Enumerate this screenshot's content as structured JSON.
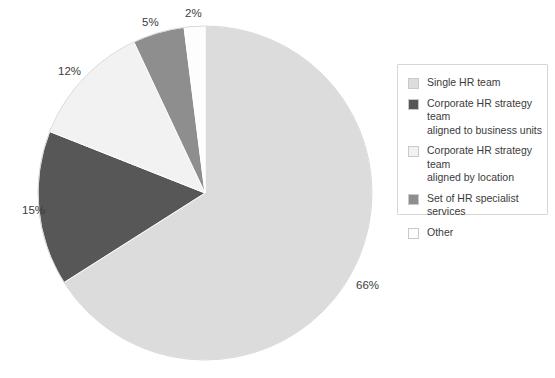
{
  "chart_data": {
    "type": "pie",
    "title": "",
    "subtitle": "",
    "xlabel": "",
    "ylabel": "",
    "legend_position": "right",
    "grid": false,
    "start_angle_deg": 0,
    "direction": "clockwise",
    "center": {
      "x": 205,
      "y": 193
    },
    "radius": 167,
    "categories": [
      "Single HR team",
      "Corporate HR strategy team aligned to business units",
      "Corporate HR strategy team aligned by location",
      "Set of HR specialist services",
      "Other"
    ],
    "values": [
      66,
      15,
      12,
      5,
      2
    ],
    "value_labels": [
      "66%",
      "15%",
      "12%",
      "5%",
      "2%"
    ],
    "unit": "%",
    "colors": [
      "#dcdcdc",
      "#575757",
      "#f2f2f2",
      "#8e8e8e",
      "#fdfdfd"
    ],
    "slices": [
      {
        "label": "Single HR team",
        "value": 66,
        "value_label": "66%",
        "color": "#dcdcdc",
        "label_x": 356,
        "label_y": 289
      },
      {
        "label": "Corporate HR strategy team aligned to business units",
        "value": 15,
        "value_label": "15%",
        "color": "#575757",
        "label_x": 22,
        "label_y": 214
      },
      {
        "label": "Corporate HR strategy team aligned by location",
        "value": 12,
        "value_label": "12%",
        "color": "#f2f2f2",
        "label_x": 58,
        "label_y": 75
      },
      {
        "label": "Set of HR specialist services",
        "value": 5,
        "value_label": "5%",
        "color": "#8e8e8e",
        "label_x": 142,
        "label_y": 26
      },
      {
        "label": "Other",
        "value": 2,
        "value_label": "2%",
        "color": "#fdfdfd",
        "label_x": 185,
        "label_y": 17
      }
    ]
  },
  "legend": {
    "items": [
      {
        "label": "Single HR team",
        "color": "#dcdcdc"
      },
      {
        "label": "Corporate HR strategy team\naligned to business units",
        "color": "#575757"
      },
      {
        "label": "Corporate HR strategy team\naligned by location",
        "color": "#f2f2f2"
      },
      {
        "label": "Set of HR specialist services",
        "color": "#8e8e8e"
      },
      {
        "label": "Other",
        "color": "#fdfdfd"
      }
    ]
  },
  "style": {
    "background": "#ffffff",
    "label_color": "#3b3b3b",
    "slice_stroke": "#ffffff",
    "legend_border": "#d6d6d6"
  }
}
